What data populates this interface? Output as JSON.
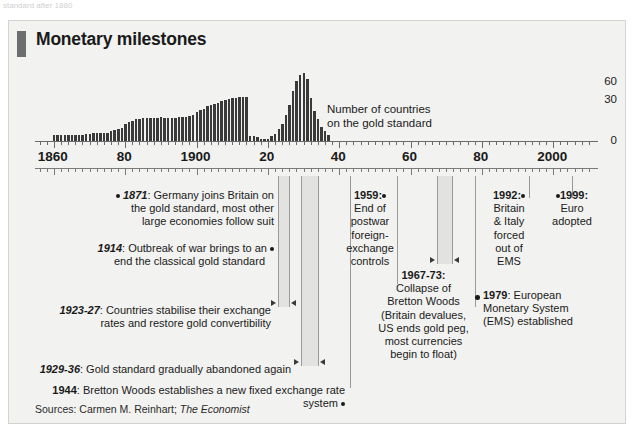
{
  "top_caption": "standard after 1880",
  "card": {
    "title": "Monetary milestones",
    "source": "Sources: Carmen M. Reinhart; ",
    "source_italic": "The Economist"
  },
  "chart_data": {
    "type": "bar",
    "title": "Number of countries on the gold standard",
    "series_note_line1": "Number of countries",
    "series_note_line2": "on the gold standard",
    "xlabel": "",
    "ylabel": "",
    "ylim": [
      0,
      60
    ],
    "yticks": [
      "60",
      "30",
      "0"
    ],
    "xlim": [
      1855,
      2012
    ],
    "xtick_labels": [
      "1860",
      "80",
      "1900",
      "20",
      "40",
      "60",
      "80",
      "2000"
    ],
    "xtick_years": [
      1860,
      1880,
      1900,
      1920,
      1940,
      1960,
      1980,
      2000
    ],
    "grid": false,
    "legend": "none",
    "x": [
      1860,
      1861,
      1862,
      1863,
      1864,
      1865,
      1866,
      1867,
      1868,
      1869,
      1870,
      1871,
      1872,
      1873,
      1874,
      1875,
      1876,
      1877,
      1878,
      1879,
      1880,
      1881,
      1882,
      1883,
      1884,
      1885,
      1886,
      1887,
      1888,
      1889,
      1890,
      1891,
      1892,
      1893,
      1894,
      1895,
      1896,
      1897,
      1898,
      1899,
      1900,
      1901,
      1902,
      1903,
      1904,
      1905,
      1906,
      1907,
      1908,
      1909,
      1910,
      1911,
      1912,
      1913,
      1914,
      1915,
      1916,
      1917,
      1918,
      1919,
      1920,
      1921,
      1922,
      1923,
      1924,
      1925,
      1926,
      1927,
      1928,
      1929,
      1930,
      1931,
      1932,
      1933,
      1934,
      1935,
      1936,
      1937
    ],
    "values": [
      5,
      5,
      5,
      5,
      5,
      5,
      5,
      5,
      5,
      6,
      6,
      7,
      7,
      7,
      7,
      7,
      8,
      9,
      10,
      11,
      14,
      16,
      17,
      18,
      18,
      19,
      19,
      19,
      19,
      19,
      20,
      19,
      19,
      19,
      19,
      20,
      20,
      20,
      21,
      22,
      24,
      26,
      27,
      29,
      30,
      31,
      32,
      33,
      34,
      35,
      36,
      36,
      37,
      37,
      37,
      4,
      4,
      3,
      2,
      2,
      2,
      4,
      6,
      10,
      14,
      22,
      30,
      42,
      50,
      55,
      57,
      52,
      36,
      25,
      18,
      12,
      8,
      5
    ]
  },
  "notes": {
    "n1871": {
      "year": "1871",
      "line1": ": Germany joins Britain on",
      "line2": "the gold standard, most other",
      "line3": "large economies follow suit"
    },
    "n1914": {
      "year": "1914",
      "line1": ": Outbreak of war brings to an",
      "line2": "end the classical gold standard"
    },
    "n1923": {
      "year": "1923-27",
      "line1": ": Countries stabilise their exchange",
      "line2": "rates and restore gold convertibility"
    },
    "n1929": {
      "year": "1929-36",
      "line1": ": Gold standard gradually abandoned again"
    },
    "n1944": {
      "year": "1944",
      "line1": ": Bretton Woods establishes a new fixed exchange rate system"
    },
    "n1959": {
      "year": "1959:",
      "line1": "End of",
      "line2": "postwar",
      "line3": "foreign-",
      "line4": "exchange",
      "line5": "controls"
    },
    "n1967": {
      "year": "1967-73:",
      "line1": "Collapse of",
      "line2": "Bretton Woods",
      "line3": "(Britain devalues,",
      "line4": "US ends gold peg,",
      "line5": "most currencies",
      "line6": "begin to float)"
    },
    "n1979": {
      "year": "1979",
      "line1": ": European",
      "line2": "Monetary System",
      "line3": "(EMS) established"
    },
    "n1992": {
      "year": "1992:",
      "line1": "Britain",
      "line2": "& Italy",
      "line3": "forced",
      "line4": "out of",
      "line5": "EMS"
    },
    "n1999": {
      "year": "1999:",
      "line1": "Euro",
      "line2": "adopted"
    }
  },
  "colors": {
    "bar": "#3a3a3a",
    "card_bg": "#f2f2f0",
    "accent_tab": "#6d6e70",
    "band": "#e2e2e0",
    "rule": "#9a9a9a"
  }
}
